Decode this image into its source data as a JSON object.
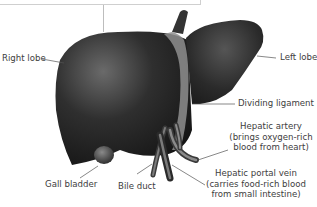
{
  "diagram": {
    "labels": {
      "right_lobe": "Right lobe",
      "left_lobe": "Left lobe",
      "dividing_ligament": "Dividing ligament",
      "hepatic_artery": {
        "line1": "Hepatic artery",
        "line2": "(brings oxygen-rich",
        "line3": "blood from heart)"
      },
      "hepatic_portal_vein": {
        "line1": "Hepatic portal vein",
        "line2": "(carries food-rich blood",
        "line3": "from small intestine)"
      },
      "gall_bladder": "Gall bladder",
      "bile_duct": "Bile duct"
    },
    "colors": {
      "organ_dark": "#1e1e1e",
      "organ_mid": "#4a4a4a",
      "organ_light": "#7a7a7a",
      "ligament": "#9a9a9a",
      "leader_line": "#555555",
      "frame": "#cfcfcf"
    }
  }
}
